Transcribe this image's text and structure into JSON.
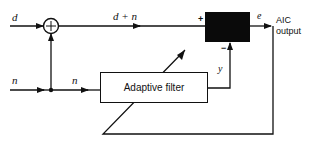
{
  "diagram": {
    "inputs": {
      "d_label": "d",
      "n_label": "n",
      "n_branch_label": "n"
    },
    "summer": {
      "symbol": "+"
    },
    "signals": {
      "sum_label": "d + n",
      "error_label": "e",
      "filter_output_label": "y"
    },
    "subtractor": {
      "plus_sign": "+",
      "minus_sign": "−"
    },
    "filter": {
      "label": "Adaptive filter"
    },
    "output": {
      "line1": "AIC",
      "line2": "output"
    }
  }
}
